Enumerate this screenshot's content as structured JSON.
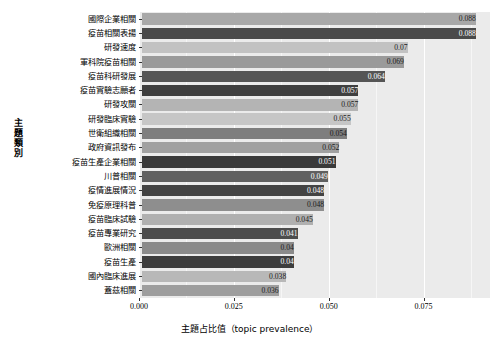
{
  "chart_data": {
    "type": "bar",
    "orientation": "horizontal",
    "title": "",
    "xlabel": "主題占比值（topic prevalence）",
    "ylabel": "主題類別",
    "xlim": [
      0.0,
      0.0925
    ],
    "grid": true,
    "legend": false,
    "xticks": [
      "0.000",
      "0.025",
      "0.050",
      "0.075"
    ],
    "xtick_values": [
      0.0,
      0.025,
      0.05,
      0.075
    ],
    "categories": [
      "國際企業相關",
      "疫苗相關表揚",
      "研發速度",
      "軍科院疫苗相關",
      "疫苗科研發展",
      "疫苗實驗志願者",
      "研發攻關",
      "研發臨床實驗",
      "世衛組織相關",
      "政府資訊發布",
      "疫苗生產企業相關",
      "川普相關",
      "疫情進展情況",
      "免疫原理科普",
      "疫苗臨床試驗",
      "疫苗專業研究",
      "歐洲相關",
      "疫苗生產",
      "國內臨床進展",
      "蓋茲相關"
    ],
    "values": [
      0.088,
      0.088,
      0.07,
      0.069,
      0.064,
      0.057,
      0.057,
      0.055,
      0.054,
      0.052,
      0.051,
      0.049,
      0.048,
      0.048,
      0.045,
      0.041,
      0.04,
      0.04,
      0.038,
      0.036
    ],
    "value_labels": [
      "0.088",
      "0.088",
      "0.07",
      "0.069",
      "0.064",
      "0.057",
      "0.057",
      "0.055",
      "0.054",
      "0.052",
      "0.051",
      "0.049",
      "0.048",
      "0.048",
      "0.045",
      "0.041",
      "0.04",
      "0.04",
      "0.038",
      "0.036"
    ],
    "bar_colors": [
      "#a8a8a8",
      "#4a4a4a",
      "#c2c2c2",
      "#9a9a9a",
      "#555555",
      "#3f3f3f",
      "#b4b4b4",
      "#c6c6c6",
      "#7e7e7e",
      "#a0a0a0",
      "#3a3a3a",
      "#606060",
      "#434343",
      "#8e8e8e",
      "#b0b0b0",
      "#4d4d4d",
      "#8a8a8a",
      "#3d3d3d",
      "#b8b8b8",
      "#9e9e9e"
    ],
    "label_colors": [
      "#1a1a1a",
      "#ffffff",
      "#1a1a1a",
      "#1a1a1a",
      "#ffffff",
      "#ffffff",
      "#1a1a1a",
      "#1a1a1a",
      "#1a1a1a",
      "#1a1a1a",
      "#ffffff",
      "#ffffff",
      "#ffffff",
      "#1a1a1a",
      "#1a1a1a",
      "#ffffff",
      "#1a1a1a",
      "#ffffff",
      "#1a1a1a",
      "#1a1a1a"
    ],
    "panel_background": "#ebebeb",
    "gridline_color": "#ffffff"
  }
}
